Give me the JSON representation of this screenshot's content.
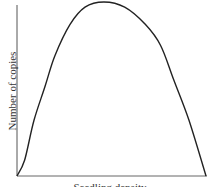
{
  "chart_data": {
    "type": "line",
    "title": "",
    "xlabel": "Seedling density",
    "ylabel": "Number of copies",
    "grid": false,
    "legend": null,
    "x_ticks": [],
    "y_ticks": [],
    "series": [
      {
        "name": "curve",
        "shape": "inverted-U (hump-shaped)",
        "x": [
          0,
          0.04,
          0.09,
          0.15,
          0.2,
          0.28,
          0.36,
          0.46,
          0.57,
          0.68,
          0.76,
          0.83,
          0.91,
          1.0
        ],
        "y": [
          0,
          0.09,
          0.32,
          0.52,
          0.69,
          0.87,
          0.97,
          1.0,
          0.97,
          0.87,
          0.75,
          0.55,
          0.32,
          0
        ]
      }
    ],
    "xlim": [
      0,
      1
    ],
    "ylim": [
      0,
      1
    ],
    "line_color": "#222222",
    "axis_color": "#555555"
  }
}
